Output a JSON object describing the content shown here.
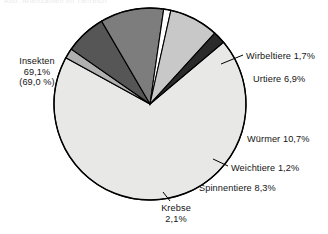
{
  "figure": {
    "top_caption": "Abb. Artenzahlen im Tierreich",
    "background": "#ffffff",
    "outline_color": "#000000"
  },
  "chart_data": {
    "type": "pie",
    "title": "",
    "xlabel": "",
    "ylabel": "",
    "units": "percent",
    "legend": "none (direct labels)",
    "grid": false,
    "total": 100.0,
    "start_angle_deg": -40,
    "direction": "clockwise",
    "categories": [
      "Insekten",
      "Wirbeltiere",
      "Urtiere",
      "Würmer",
      "Weichtiere",
      "Spinnentiere",
      "Krebse"
    ],
    "values": [
      69.1,
      1.7,
      6.9,
      10.7,
      1.2,
      8.3,
      2.1
    ],
    "colors": [
      "#e8e8e6",
      "#b0b0b0",
      "#565656",
      "#7d7d7d",
      "#ffffff",
      "#c8c8c8",
      "#2a2a2a"
    ],
    "slices": [
      {
        "name": "Insekten",
        "value": 69.1,
        "value_text": "69,1%",
        "secondary_text": "(69,0 %)",
        "label_lines": [
          "Insekten",
          "69,1%",
          "(69,0 %)"
        ],
        "color": "#e8e8e6",
        "leader": false
      },
      {
        "name": "Wirbeltiere",
        "value": 1.7,
        "value_text": "1,7%",
        "label_lines": [
          "Wirbeltiere 1,7%"
        ],
        "color": "#b0b0b0",
        "leader": true
      },
      {
        "name": "Urtiere",
        "value": 6.9,
        "value_text": "6,9%",
        "label_lines": [
          "Urtiere 6,9%"
        ],
        "color": "#565656",
        "leader": false
      },
      {
        "name": "Würmer",
        "value": 10.7,
        "value_text": "10,7%",
        "label_lines": [
          "Würmer 10,7%"
        ],
        "color": "#7d7d7d",
        "leader": false
      },
      {
        "name": "Weichtiere",
        "value": 1.2,
        "value_text": "1,2%",
        "label_lines": [
          "Weichtiere 1,2%"
        ],
        "color": "#ffffff",
        "leader": true
      },
      {
        "name": "Spinnentiere",
        "value": 8.3,
        "value_text": "8,3%",
        "label_lines": [
          "Spinnentiere 8,3%"
        ],
        "color": "#c8c8c8",
        "leader": false
      },
      {
        "name": "Krebse",
        "value": 2.1,
        "value_text": "2,1%",
        "label_lines": [
          "Krebse",
          "2,1%"
        ],
        "color": "#2a2a2a",
        "leader": true
      }
    ]
  },
  "labels": {
    "insekten_l1": "Insekten",
    "insekten_l2": "69,1%",
    "insekten_l3": "(69,0 %)",
    "wirbeltiere": "Wirbeltiere 1,7%",
    "urtiere": "Urtiere 6,9%",
    "wuermer": "Würmer 10,7%",
    "weichtiere": "Weichtiere 1,2%",
    "spinnentiere": "Spinnentiere 8,3%",
    "krebse_l1": "Krebse",
    "krebse_l2": "2,1%"
  }
}
